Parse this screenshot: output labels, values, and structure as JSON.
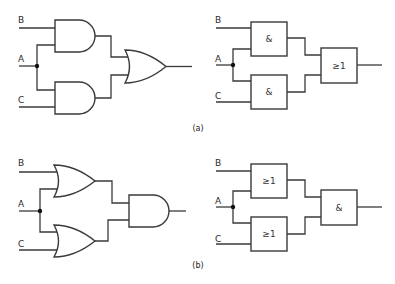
{
  "diagram": {
    "type": "logic-gate-equivalence",
    "parts": [
      {
        "caption": "(a)",
        "inputs": [
          "B",
          "A",
          "C"
        ],
        "distinctive_shapes": {
          "first_stage": [
            "AND",
            "AND"
          ],
          "second_stage": "OR"
        },
        "iec_symbols": {
          "first_stage": [
            "&",
            "&"
          ],
          "second_stage": "≥1"
        }
      },
      {
        "caption": "(b)",
        "inputs": [
          "B",
          "A",
          "C"
        ],
        "distinctive_shapes": {
          "first_stage": [
            "OR",
            "OR"
          ],
          "second_stage": "AND"
        },
        "iec_symbols": {
          "first_stage": [
            "≥1",
            "≥1"
          ],
          "second_stage": "&"
        }
      }
    ]
  },
  "labels": {
    "a": {
      "caption": "(a)",
      "B": "B",
      "A": "A",
      "C": "C",
      "g1": "&",
      "g2": "&",
      "g3": "≥1"
    },
    "b": {
      "caption": "(b)",
      "B": "B",
      "A": "A",
      "C": "C",
      "g1": "≥1",
      "g2": "≥1",
      "g3": "&"
    }
  }
}
